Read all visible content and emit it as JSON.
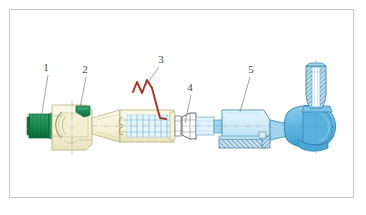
{
  "figure": {
    "frame": {
      "border_color": "#c8c8c8",
      "background_color": "#ffffff"
    }
  },
  "callouts": [
    {
      "id": "callout-1",
      "label": "1",
      "text_x": 46,
      "text_y": 71,
      "leader_x1": 48,
      "leader_y1": 75,
      "leader_x2": 42,
      "leader_y2": 113,
      "target": "green-threaded-end-plug"
    },
    {
      "id": "callout-2",
      "label": "2",
      "text_x": 85,
      "text_y": 73,
      "leader_x1": 86,
      "leader_y1": 77,
      "leader_x2": 80,
      "leader_y2": 108,
      "target": "green-ball-socket-insert"
    },
    {
      "id": "callout-3",
      "label": "3",
      "text_x": 160,
      "text_y": 63,
      "leader_x1": 159,
      "leader_y1": 67,
      "leader_x2": 148,
      "leader_y2": 84,
      "target": "red-spring-wire-clip"
    },
    {
      "id": "callout-4",
      "label": "4",
      "text_x": 190,
      "text_y": 91,
      "leader_x1": 191,
      "leader_y1": 95,
      "leader_x2": 185,
      "leader_y2": 122,
      "target": "hex-lock-nut"
    },
    {
      "id": "callout-5",
      "label": "5",
      "text_x": 251,
      "text_y": 73,
      "leader_x1": 250,
      "leader_y1": 77,
      "leader_x2": 238,
      "leader_y2": 113,
      "target": "blue-outer-tie-rod-housing"
    }
  ],
  "colors": {
    "cream_fill": "#f7f4da",
    "cream_edge": "#c3bd7f",
    "green_fill": "#1e8a53",
    "green_dark": "#0d6b3b",
    "blue_light": "#d3edf8",
    "blue_mid": "#9ed4ee",
    "blue_strong": "#4fb0dd",
    "blue_edge": "#2b7fb0",
    "red_clip": "#b03a2a",
    "white_fill": "#ffffff",
    "line_dark": "#3a3a3a",
    "centerline": "#5a6a9a",
    "hatch": "#5a7fa0",
    "frame": "#c8c8c8",
    "text": "#4a4a4a"
  },
  "parts": {
    "left_end_plug": {
      "name": "Green threaded end plug",
      "color": "#1e8a53"
    },
    "inner_socket_housing": {
      "name": "Inner ball socket housing",
      "color": "#f7f4da"
    },
    "socket_insert": {
      "name": "Green socket insert cap",
      "color": "#0d6b3b"
    },
    "tapered_shaft": {
      "name": "Tapered rod shaft",
      "color": "#f7f4da"
    },
    "bellows_boot": {
      "name": "Convoluted bellows boot",
      "color": "#d3edf8"
    },
    "spring_clip": {
      "name": "Spring wire retaining clip",
      "color": "#b03a2a"
    },
    "lock_nut": {
      "name": "Hexagonal lock nut",
      "color": "#ffffff"
    },
    "adjuster_sleeve": {
      "name": "Adjuster sleeve",
      "color": "#9ed4ee"
    },
    "outer_housing": {
      "name": "Outer tie rod end housing",
      "color": "#d3edf8"
    },
    "hatched_section": {
      "name": "Sectioned hatched clamp",
      "color": "#5a7fa0"
    },
    "ball_joint": {
      "name": "Ball joint head",
      "color": "#4fb0dd"
    },
    "threaded_stud": {
      "name": "Threaded taper stud",
      "color": "#9ed4ee"
    }
  }
}
